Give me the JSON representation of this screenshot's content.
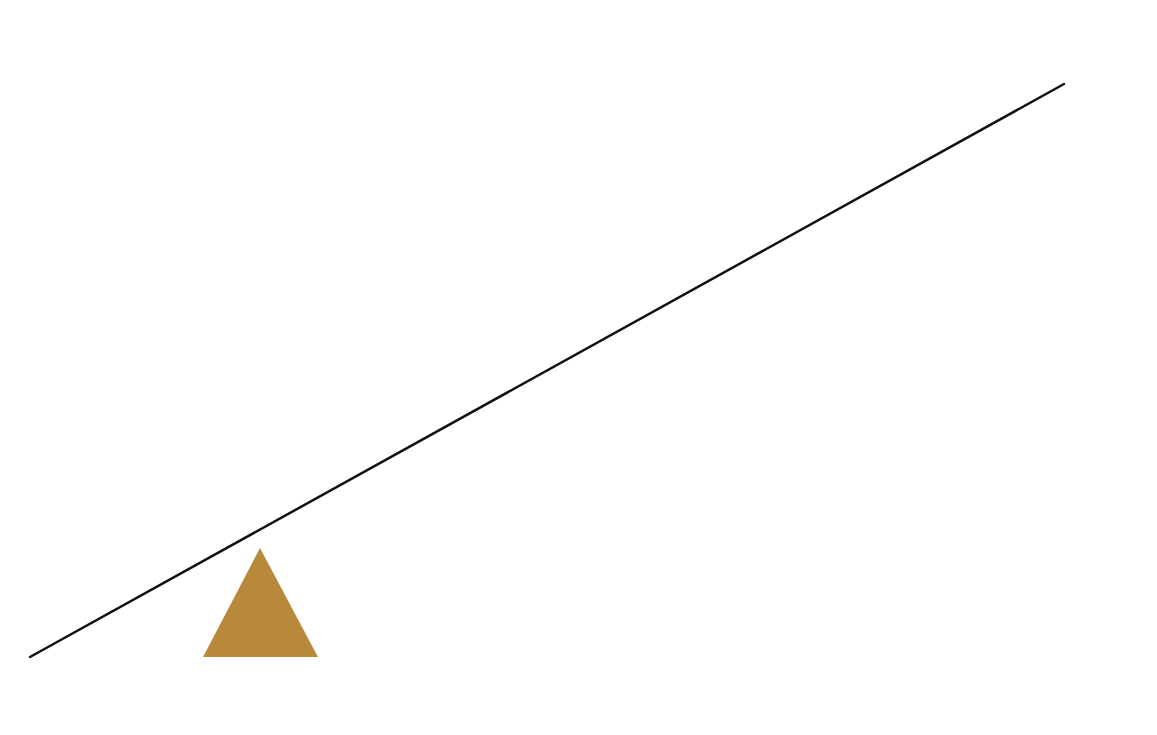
{
  "diagram": {
    "type": "lever-fulcrum",
    "background": "#ffffff",
    "lever": {
      "x1": 30,
      "y1": 657,
      "x2": 1064,
      "y2": 84,
      "color": "#111111",
      "stroke_width": 2.5
    },
    "fulcrum": {
      "shape": "triangle",
      "apex": [
        260,
        548
      ],
      "base_left": [
        203,
        657
      ],
      "base_right": [
        318,
        657
      ],
      "color": "#B8893A"
    }
  }
}
